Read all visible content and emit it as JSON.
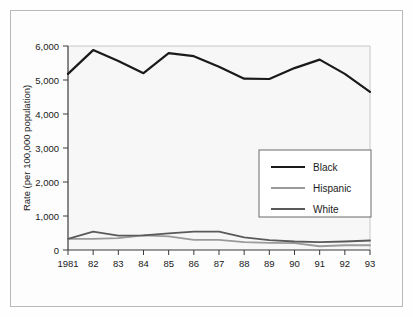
{
  "chart_data": {
    "type": "line",
    "title": "",
    "xlabel": "",
    "ylabel": "Rate (per 100,000 population)",
    "categories": [
      "1981",
      "82",
      "83",
      "84",
      "85",
      "86",
      "87",
      "88",
      "89",
      "90",
      "91",
      "92",
      "93"
    ],
    "x": [
      1981,
      1982,
      1983,
      1984,
      1985,
      1986,
      1987,
      1988,
      1989,
      1990,
      1991,
      1992,
      1993
    ],
    "ylim": [
      0,
      6000
    ],
    "yticks": [
      0,
      1000,
      2000,
      3000,
      4000,
      5000,
      6000
    ],
    "ytick_labels": [
      "0",
      "1,000",
      "2,000",
      "3,000",
      "4,000",
      "5,000",
      "6,000"
    ],
    "grid": false,
    "legend_position": "center-right",
    "series": [
      {
        "name": "Black",
        "color": "#1a1a1a",
        "values": [
          5180,
          5880,
          5560,
          5200,
          5790,
          5700,
          5390,
          5040,
          5030,
          5350,
          5600,
          5180,
          4650
        ]
      },
      {
        "name": "Hispanic",
        "color": "#9a9a9a",
        "values": [
          330,
          330,
          350,
          430,
          400,
          300,
          300,
          230,
          210,
          200,
          110,
          140,
          140
        ]
      },
      {
        "name": "White",
        "color": "#5a5a5a",
        "values": [
          330,
          540,
          420,
          430,
          490,
          540,
          540,
          370,
          290,
          250,
          230,
          250,
          280
        ]
      }
    ]
  },
  "axes": {
    "y_axis_title": "Rate (per 100,000 population)"
  },
  "legend": {
    "entries": [
      {
        "label": "Black"
      },
      {
        "label": "Hispanic"
      },
      {
        "label": "White"
      }
    ]
  }
}
